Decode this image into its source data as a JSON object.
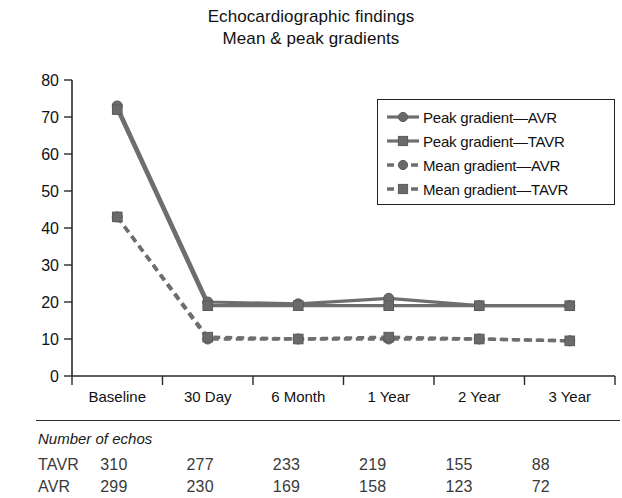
{
  "title": {
    "line1": "Echocardiographic findings",
    "line2": "Mean & peak gradients"
  },
  "legend": {
    "items": [
      {
        "label": "Peak gradient—AVR",
        "marker": "circle",
        "line": "solid"
      },
      {
        "label": "Peak gradient—TAVR",
        "marker": "square",
        "line": "solid"
      },
      {
        "label": "Mean gradient—AVR",
        "marker": "circle",
        "line": "dashed"
      },
      {
        "label": "Mean gradient—TAVR",
        "marker": "square",
        "line": "dashed"
      }
    ]
  },
  "footer": {
    "caption": "Number of echos",
    "rows": [
      {
        "label": "TAVR",
        "values": [
          "310",
          "277",
          "233",
          "219",
          "155",
          "88"
        ]
      },
      {
        "label": "AVR",
        "values": [
          "299",
          "230",
          "169",
          "158",
          "123",
          "72"
        ]
      }
    ]
  },
  "chart_data": {
    "type": "line",
    "xlabel": "",
    "ylabel": "",
    "categories": [
      "Baseline",
      "30 Day",
      "6 Month",
      "1 Year",
      "2 Year",
      "3 Year"
    ],
    "ylim": [
      0,
      80
    ],
    "yticks": [
      0,
      10,
      20,
      30,
      40,
      50,
      60,
      70,
      80
    ],
    "grid": false,
    "legend_position": "upper-right-inside",
    "series": [
      {
        "name": "Peak gradient—AVR",
        "marker": "circle",
        "line": "solid",
        "color": "#6e6e6e",
        "values": [
          73,
          20,
          19.5,
          21,
          19,
          19
        ]
      },
      {
        "name": "Peak gradient—TAVR",
        "marker": "square",
        "line": "solid",
        "color": "#6e6e6e",
        "values": [
          72,
          19,
          19,
          19,
          19,
          19
        ]
      },
      {
        "name": "Mean gradient—AVR",
        "marker": "circle",
        "line": "dashed",
        "color": "#6e6e6e",
        "values": [
          43,
          10,
          10,
          10,
          10,
          9.5
        ]
      },
      {
        "name": "Mean gradient—TAVR",
        "marker": "square",
        "line": "dashed",
        "color": "#6e6e6e",
        "values": [
          43,
          10.5,
          10,
          10.5,
          10,
          9.5
        ]
      }
    ]
  }
}
